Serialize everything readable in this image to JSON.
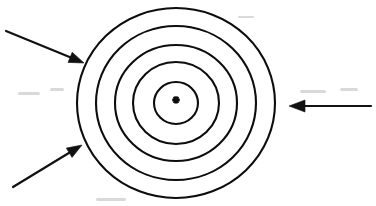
{
  "figure": {
    "kind": "concentric-circles-diagram",
    "background_color": "#ffffff",
    "ink_color": "#111111",
    "width": 376,
    "height": 206,
    "title": "",
    "caption": ""
  },
  "target": {
    "name": "concentric-rings",
    "center": {
      "x": 176,
      "y": 103
    },
    "ring_count": 5,
    "stroke_color": "#0d0d0d",
    "stroke_width": 2.1,
    "fill": "none",
    "rings": [
      {
        "label": "ring-1-outermost",
        "rx": 99,
        "ry": 95
      },
      {
        "label": "ring-2",
        "rx": 80,
        "ry": 77
      },
      {
        "label": "ring-3",
        "rx": 61,
        "ry": 58
      },
      {
        "label": "ring-4",
        "rx": 43,
        "ry": 41
      },
      {
        "label": "ring-5-innermost",
        "rx": 22,
        "ry": 21
      }
    ]
  },
  "center_mark": {
    "name": "center-asterisk",
    "glyph": "asterisk",
    "color": "#0d0d0d",
    "size": 9
  },
  "arrows": [
    {
      "name": "arrow-upper-left",
      "direction": "down-right",
      "color": "#111111",
      "tail": {
        "x": 6,
        "y": 31
      },
      "tip": {
        "x": 84,
        "y": 63
      },
      "head_length": 15,
      "head_width": 11
    },
    {
      "name": "arrow-lower-left",
      "direction": "up-right",
      "color": "#111111",
      "tail": {
        "x": 13,
        "y": 187
      },
      "tip": {
        "x": 82,
        "y": 145
      },
      "head_length": 15,
      "head_width": 11
    },
    {
      "name": "arrow-right",
      "direction": "left",
      "color": "#111111",
      "tail": {
        "x": 371,
        "y": 106
      },
      "tip": {
        "x": 289,
        "y": 106
      },
      "head_length": 16,
      "head_width": 12
    }
  ],
  "scan_specks": [
    {
      "x": 18,
      "y": 92,
      "w": 22,
      "h": 3
    },
    {
      "x": 50,
      "y": 88,
      "w": 14,
      "h": 3
    },
    {
      "x": 300,
      "y": 90,
      "w": 26,
      "h": 3
    },
    {
      "x": 340,
      "y": 88,
      "w": 18,
      "h": 3
    },
    {
      "x": 96,
      "y": 198,
      "w": 30,
      "h": 3
    },
    {
      "x": 238,
      "y": 16,
      "w": 16,
      "h": 2
    }
  ]
}
